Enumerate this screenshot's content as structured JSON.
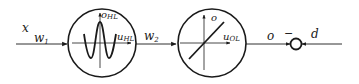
{
  "diagram": {
    "type": "block-diagram",
    "colors": {
      "stroke": "#1a1a1a",
      "background": "#ffffff"
    },
    "input": {
      "label": "x",
      "weight": "w",
      "weight_sub": "1"
    },
    "hidden_layer": {
      "icon": "sinusoid-activation-icon",
      "y_axis": {
        "label": "o",
        "sub": "HL"
      },
      "x_axis": {
        "label": "u",
        "sub": "HL"
      }
    },
    "link": {
      "weight": "w",
      "weight_sub": "2"
    },
    "output_layer": {
      "icon": "linear-activation-icon",
      "y_axis": {
        "label": "o",
        "sub": ""
      },
      "x_axis": {
        "label": "u",
        "sub": "OL"
      }
    },
    "output": {
      "label": "o"
    },
    "summing_junction": {
      "sign": "−",
      "reference": "d"
    }
  }
}
